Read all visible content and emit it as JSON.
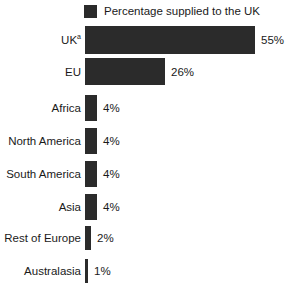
{
  "chart_data": {
    "type": "bar",
    "orientation": "horizontal",
    "title": "",
    "xlabel": "",
    "ylabel": "",
    "grid": false,
    "legend_position": "top-left",
    "xlim": [
      0,
      55
    ],
    "categories": [
      "UK",
      "EU",
      "Africa",
      "North America",
      "South America",
      "Asia",
      "Rest of Europe",
      "Australasia"
    ],
    "values": [
      55,
      26,
      4,
      4,
      4,
      4,
      2,
      1
    ],
    "value_labels": [
      "55%",
      "26%",
      "4%",
      "4%",
      "4%",
      "4%",
      "2%",
      "1%"
    ],
    "category_footnotes": [
      "a",
      "",
      "",
      "",
      "",
      "",
      "",
      ""
    ],
    "series": [
      {
        "name": "Percentage supplied to the UK",
        "values": [
          55,
          26,
          4,
          4,
          4,
          4,
          2,
          1
        ],
        "color": "#2b2b2b"
      }
    ]
  },
  "legend": {
    "label": "Percentage supplied to the UK",
    "swatch_color": "#2b2b2b"
  },
  "rows": [
    {
      "category": "UK",
      "footnote": "a",
      "value_label": "55%"
    },
    {
      "category": "EU",
      "footnote": "",
      "value_label": "26%"
    },
    {
      "category": "Africa",
      "footnote": "",
      "value_label": "4%"
    },
    {
      "category": "North America",
      "footnote": "",
      "value_label": "4%"
    },
    {
      "category": "South America",
      "footnote": "",
      "value_label": "4%"
    },
    {
      "category": "Asia",
      "footnote": "",
      "value_label": "4%"
    },
    {
      "category": "Rest of Europe",
      "footnote": "",
      "value_label": "2%"
    },
    {
      "category": "Australasia",
      "footnote": "",
      "value_label": "1%"
    }
  ],
  "colors": {
    "bar": "#2b2b2b",
    "text": "#1a1a1a",
    "background": "#ffffff"
  }
}
